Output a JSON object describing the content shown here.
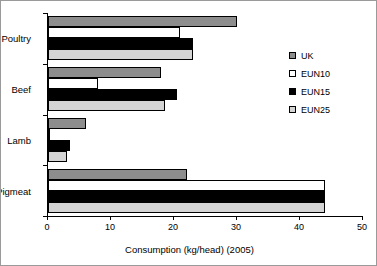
{
  "chart_data": {
    "type": "bar",
    "orientation": "horizontal",
    "title": "",
    "xlabel": "Consumption (kg/head) (2005)",
    "ylabel": "",
    "xlim": [
      0,
      50
    ],
    "xticks": [
      0,
      10,
      20,
      30,
      40,
      50
    ],
    "xtick_labels": [
      "0",
      "10",
      "20",
      "30",
      "40",
      "50"
    ],
    "grid": false,
    "legend_position": "right",
    "categories": [
      "Poultry",
      "Beef",
      "Lamb",
      "Pigmeat"
    ],
    "series": [
      {
        "name": "UK",
        "color": "#8d8d8d",
        "values": [
          30,
          18,
          6,
          22
        ]
      },
      {
        "name": "EUN10",
        "color": "#ffffff",
        "values": [
          21,
          8,
          0.3,
          44
        ]
      },
      {
        "name": "EUN15",
        "color": "#000000",
        "values": [
          23,
          20.5,
          3.5,
          44
        ]
      },
      {
        "name": "EUN25",
        "color": "#d4d4d4",
        "values": [
          23,
          18.5,
          3,
          44
        ]
      }
    ]
  },
  "legend": {
    "items": [
      {
        "label": "UK",
        "swatch": "uk"
      },
      {
        "label": "EUN10",
        "swatch": "eun10"
      },
      {
        "label": "EUN15",
        "swatch": "eun15"
      },
      {
        "label": "EUN25",
        "swatch": "eun25"
      }
    ]
  },
  "axis": {
    "x_title": "Consumption (kg/head) (2005)"
  }
}
